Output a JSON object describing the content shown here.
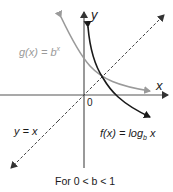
{
  "diagram": {
    "axes": {
      "x_label": "x",
      "y_label": "y",
      "origin_label": "0"
    },
    "curves": [
      {
        "name": "g",
        "label_prefix": "g(x) = b",
        "label_sup": "x",
        "color": "#9a9a9a",
        "kind": "exponential"
      },
      {
        "name": "f",
        "label_prefix": "f(x) = log",
        "label_sub": "b",
        "label_suffix": " x",
        "color": "#1a1a1a",
        "kind": "logarithm"
      }
    ],
    "reflection_line": {
      "label": "y = x",
      "style": "dashed",
      "color": "#333333"
    },
    "caption": "For 0 < b < 1",
    "colors": {
      "axis": "#555555",
      "exp_curve": "#9a9a9a",
      "log_curve": "#1a1a1a"
    }
  }
}
